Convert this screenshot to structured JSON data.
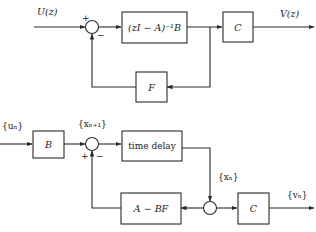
{
  "diagram": {
    "top": {
      "input_label": "U(z)",
      "output_label": "V(z)",
      "sum_plus": "+",
      "sum_minus": "−",
      "plant_block": "(zI − A)⁻¹B",
      "output_block": "C",
      "feedback_block": "F"
    },
    "bottom": {
      "input_label": "{uₙ}",
      "state_next_label": "{xₙ₊₁}",
      "state_label": "{xₙ}",
      "output_label": "{vₙ}",
      "sum_plus": "+",
      "sum_minus": "−",
      "input_block": "B",
      "delay_block": "time delay",
      "feedback_block": "A − BF",
      "output_block": "C"
    }
  }
}
